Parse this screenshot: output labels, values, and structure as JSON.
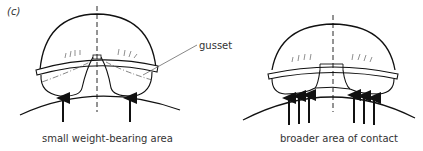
{
  "figure": {
    "panel_label": "(c)",
    "callout": "gusset",
    "left_diagram": {
      "caption": "small weight-bearing area",
      "arrow_count": 2
    },
    "right_diagram": {
      "caption": "broader area of contact",
      "arrow_count": 6
    }
  }
}
